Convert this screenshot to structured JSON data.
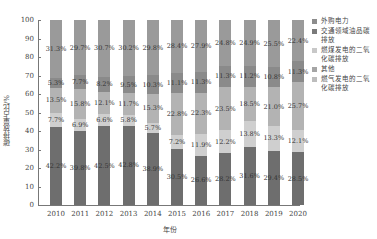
{
  "chart_data": {
    "type": "bar",
    "stacked": true,
    "title": "",
    "xlabel": "年份",
    "ylabel": "碳排放量占比/%",
    "ylim": [
      0,
      100
    ],
    "yticks": [
      0,
      10,
      20,
      30,
      40,
      50,
      60,
      70,
      80,
      90,
      100
    ],
    "categories": [
      "2010",
      "2011",
      "2012",
      "2013",
      "2014",
      "2015",
      "2016",
      "2017",
      "2018",
      "2019",
      "2020"
    ],
    "series": [
      {
        "name": "燃气发电的二氧化碳排放",
        "color": "#6e6e6e",
        "values": [
          42.2,
          39.8,
          42.5,
          42.8,
          38.9,
          30.5,
          26.6,
          28.2,
          31.6,
          29.4,
          28.5
        ]
      },
      {
        "name": "其他",
        "color": "#cfcfcf",
        "values": [
          7.7,
          6.9,
          6.6,
          5.8,
          5.7,
          7.2,
          11.9,
          12.2,
          13.8,
          13.3,
          12.1
        ]
      },
      {
        "name": "燃煤发电的二氧化碳排放",
        "color": "#b3b3b3",
        "values": [
          13.5,
          15.8,
          12.1,
          11.7,
          15.3,
          22.8,
          22.3,
          23.5,
          18.5,
          21.0,
          25.7
        ]
      },
      {
        "name": "交通领域油品碳排放",
        "color": "#8a8a8a",
        "values": [
          5.3,
          7.7,
          8.2,
          9.5,
          10.3,
          11.1,
          11.3,
          11.3,
          11.2,
          10.8,
          11.3
        ]
      },
      {
        "name": "外购电力",
        "color": "#9a9a9a",
        "values": [
          31.3,
          29.7,
          30.7,
          30.2,
          29.8,
          28.4,
          27.9,
          24.8,
          24.9,
          25.5,
          22.4
        ]
      }
    ],
    "legend": {
      "position": "right",
      "entries": [
        "外购电力",
        "交通领域油品碳排放",
        "燃煤发电的二氧化碳排放",
        "其他",
        "燃气发电的二氧化碳排放"
      ]
    },
    "grid": false
  },
  "axis": {
    "xlabel": "年份",
    "ylabel": "碳排放量占比/%"
  },
  "legend": [
    {
      "label": "外购电力",
      "color": "#8c8c8c"
    },
    {
      "label": "交通领域油品碳排放",
      "color": "#7a7a7a"
    },
    {
      "label": "燃煤发电的二氧化碳排放",
      "color": "#c8c8c8"
    },
    {
      "label": "其他",
      "color": "#a5a5a5"
    },
    {
      "label": "燃气发电的二氧化碳排放",
      "color": "#bdbdbd"
    }
  ]
}
